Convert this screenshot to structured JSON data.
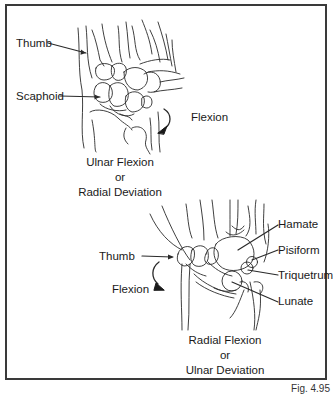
{
  "figure": {
    "caption": "Fig. 4.95",
    "border_color": "#3a3a3a",
    "line_color": "#2a2a2a"
  },
  "top_panel": {
    "labels": {
      "thumb": "Thumb",
      "scaphoid": "Scaphoid",
      "motion": "Flexion"
    },
    "caption": {
      "line1": "Ulnar Flexion",
      "line2": "or",
      "line3": "Radial Deviation"
    },
    "arrow_direction": "counter-clockwise down-left"
  },
  "bottom_panel": {
    "labels": {
      "thumb": "Thumb",
      "motion": "Flexion",
      "hamate": "Hamate",
      "pisiform": "Pisiform",
      "triquetrum": "Triquetrum",
      "lunate": "Lunate"
    },
    "caption": {
      "line1": "Radial Flexion",
      "line2": "or",
      "line3": "Ulnar Deviation"
    },
    "arrow_direction": "clockwise down-right"
  }
}
